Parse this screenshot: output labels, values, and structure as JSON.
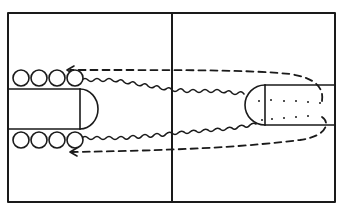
{
  "diagram": {
    "type": "basketball-drill",
    "colors": {
      "line": "#1a1a1a",
      "background": "#ffffff"
    },
    "court": {
      "left": 8,
      "top": 13,
      "right": 335,
      "bottom": 202,
      "center_x": 172
    },
    "left_key": {
      "top": 89,
      "bottom": 129,
      "free_throw_x": 80,
      "arc_tip_x": 98
    },
    "right_key": {
      "top": 85,
      "bottom": 125,
      "free_throw_x": 265,
      "arc_tip_x": 245
    },
    "players": {
      "top_row": [
        {
          "x": 21,
          "y": 78
        },
        {
          "x": 39,
          "y": 78
        },
        {
          "x": 57,
          "y": 78
        },
        {
          "x": 75,
          "y": 78
        }
      ],
      "bottom_row": [
        {
          "x": 21,
          "y": 140
        },
        {
          "x": 39,
          "y": 140
        },
        {
          "x": 57,
          "y": 140
        },
        {
          "x": 75,
          "y": 140
        }
      ]
    },
    "paths": {
      "top_dribble": "wavy",
      "bottom_dribble": "wavy",
      "top_return": "dashed-arrow",
      "bottom_return": "dashed-arrow"
    },
    "dots_top": [
      [
        259,
        101
      ],
      [
        271,
        100
      ],
      [
        284,
        101
      ],
      [
        296,
        101
      ],
      [
        308,
        102
      ],
      [
        320,
        103
      ]
    ],
    "dots_bottom": [
      [
        262,
        120
      ],
      [
        272,
        119
      ],
      [
        284,
        118
      ],
      [
        296,
        117
      ],
      [
        308,
        116
      ]
    ]
  }
}
